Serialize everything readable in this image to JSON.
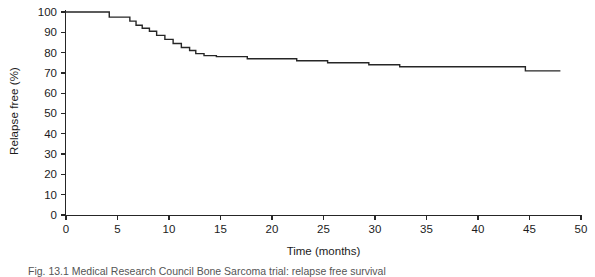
{
  "figure": {
    "caption": "Fig. 13.1 Medical Research Council Bone Sarcoma trial: relapse free survival"
  },
  "chart_data": {
    "type": "line",
    "subtype": "kaplan-meier-step",
    "title": "",
    "xlabel": "Time (months)",
    "ylabel": "Relapse free (%)",
    "xlim": [
      0,
      50
    ],
    "ylim": [
      0,
      100
    ],
    "xticks": [
      0,
      5,
      10,
      15,
      20,
      25,
      30,
      35,
      40,
      45,
      50
    ],
    "yticks": [
      0,
      10,
      20,
      30,
      40,
      50,
      60,
      70,
      80,
      90,
      100
    ],
    "grid": false,
    "legend": null,
    "line_color": "#262626",
    "series": [
      {
        "name": "Relapse free survival",
        "step": "post",
        "x": [
          0,
          3.8,
          4.2,
          5.6,
          6.2,
          6.8,
          7.4,
          8.1,
          8.8,
          9.6,
          10.4,
          11.2,
          12.0,
          12.6,
          13.4,
          14.6,
          17.0,
          17.6,
          20.8,
          22.4,
          24.8,
          25.4,
          28.6,
          29.4,
          32.4,
          44.0,
          44.6,
          48.0
        ],
        "y": [
          100,
          100,
          97.5,
          97.5,
          95.5,
          93.5,
          92.0,
          90.5,
          88.5,
          86.5,
          84.5,
          82.5,
          81.0,
          79.5,
          78.5,
          78.0,
          78.0,
          77.0,
          77.0,
          76.0,
          76.0,
          75.0,
          75.0,
          74.0,
          73.0,
          73.0,
          71.0,
          71.0
        ]
      }
    ]
  },
  "axes": {
    "x_tick_labels": [
      "0",
      "5",
      "10",
      "15",
      "20",
      "25",
      "30",
      "35",
      "40",
      "45",
      "50"
    ],
    "y_tick_labels": [
      "0",
      "10",
      "20",
      "30",
      "40",
      "50",
      "60",
      "70",
      "80",
      "90",
      "100"
    ]
  }
}
